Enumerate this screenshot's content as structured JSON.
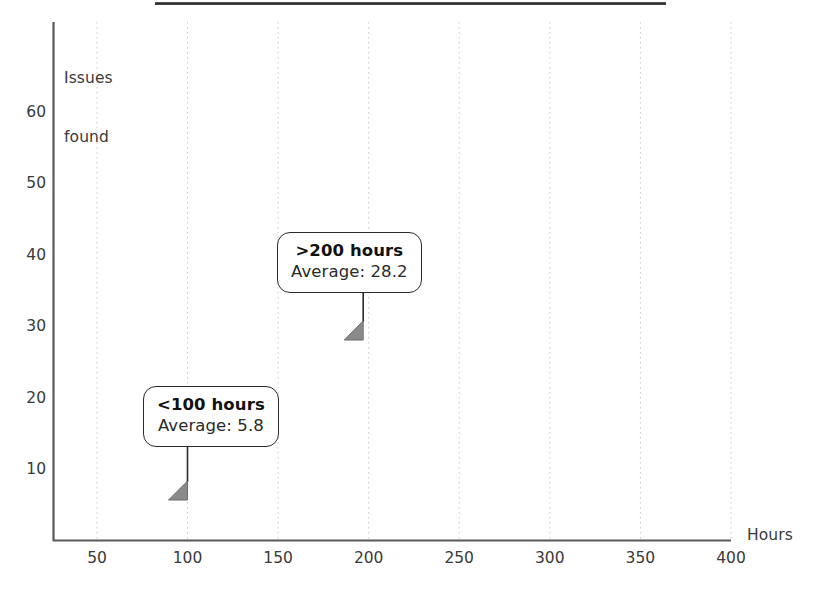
{
  "chart_data": {
    "type": "scatter",
    "title": "",
    "xlabel": "Hours",
    "ylabel": "Issues\nfound",
    "ylabel_line1": "Issues",
    "ylabel_line2": "found",
    "xlim": [
      0,
      420
    ],
    "ylim": [
      0,
      66
    ],
    "xticks": [
      50,
      100,
      150,
      200,
      250,
      300,
      350,
      400
    ],
    "yticks": [
      10,
      20,
      30,
      40,
      50,
      60
    ],
    "xtick_labels": [
      "50",
      "100",
      "150",
      "200",
      "250",
      "300",
      "350",
      "400"
    ],
    "ytick_labels": [
      "10",
      "20",
      "30",
      "40",
      "50",
      "60"
    ],
    "grid": "vertical dotted gridlines at each x tick",
    "legend": "none",
    "marker": "diamond",
    "marker_color": "#1a1a1a",
    "highlight_marker_color": "#808080",
    "series": [
      {
        "name": "Inspections",
        "points": [
          [
            44,
            9
          ],
          [
            49,
            2
          ],
          [
            63,
            1
          ],
          [
            64,
            7
          ],
          [
            71,
            1
          ],
          [
            72,
            4
          ],
          [
            73,
            5
          ],
          [
            82,
            5
          ],
          [
            84,
            6
          ],
          [
            85,
            5
          ],
          [
            87,
            5
          ],
          [
            88,
            6
          ],
          [
            90,
            5
          ],
          [
            92,
            3
          ],
          [
            99,
            5
          ],
          [
            104,
            5
          ],
          [
            113,
            3
          ],
          [
            115,
            22
          ],
          [
            118,
            9
          ],
          [
            121,
            25
          ],
          [
            124,
            8
          ],
          [
            126,
            5
          ],
          [
            133,
            47
          ],
          [
            136,
            9
          ],
          [
            138,
            1
          ],
          [
            140,
            28
          ],
          [
            144,
            17
          ],
          [
            147,
            7
          ],
          [
            151,
            15
          ],
          [
            156,
            24
          ],
          [
            158,
            20
          ],
          [
            160,
            5
          ],
          [
            163,
            5
          ],
          [
            168,
            19
          ],
          [
            178,
            5
          ],
          [
            196,
            17
          ],
          [
            199,
            11
          ],
          [
            215,
            46
          ],
          [
            249,
            13
          ],
          [
            264,
            16
          ],
          [
            285,
            61
          ],
          [
            293,
            4
          ],
          [
            324,
            26
          ],
          [
            385,
            23
          ],
          [
            403,
            28
          ]
        ]
      }
    ],
    "highlights": [
      {
        "id": "low",
        "x": 100,
        "y": 5.8,
        "label": "<100 hours",
        "sublabel": "Average: 5.8"
      },
      {
        "id": "high",
        "x": 197,
        "y": 28.2,
        "label": ">200 hours",
        "sublabel": "Average: 28.2"
      }
    ],
    "annotations": [
      {
        "id": "callout-low",
        "line1": "<100 hours",
        "line2": "Average: 5.8"
      },
      {
        "id": "callout-high",
        "line1": ">200 hours",
        "line2": "Average: 28.2"
      }
    ]
  },
  "callouts": {
    "low": {
      "title": "<100 hours",
      "average": "Average: 5.8"
    },
    "high": {
      "title": ">200 hours",
      "average": "Average: 28.2"
    }
  },
  "axes": {
    "y_title_line1": "Issues",
    "y_title_line2": "found",
    "x_title": "Hours"
  }
}
